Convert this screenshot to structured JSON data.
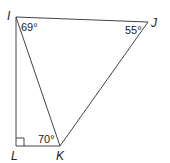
{
  "diagram": {
    "type": "geometry",
    "vertices": {
      "I": {
        "label": "I",
        "x": 16,
        "y": 17
      },
      "J": {
        "label": "J",
        "x": 148,
        "y": 22
      },
      "K": {
        "label": "K",
        "x": 60,
        "y": 146
      },
      "L": {
        "label": "L",
        "x": 16,
        "y": 146
      }
    },
    "segments": [
      "IJ",
      "JK",
      "IK",
      "IL",
      "LK"
    ],
    "angles": {
      "I": "69°",
      "J": "55°",
      "K": "70°"
    },
    "right_angle_at": "L",
    "colors": {
      "stroke": "#333333",
      "text": "#222222"
    }
  }
}
